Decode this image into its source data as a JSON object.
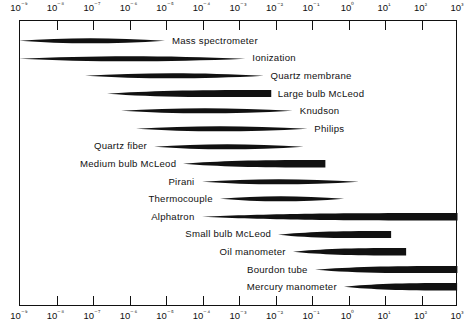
{
  "chart_data": {
    "type": "bar",
    "title": "",
    "xlabel": "",
    "ylabel": "",
    "orientation": "horizontal",
    "x_scale": "log10",
    "xlim": [
      -9,
      3
    ],
    "grid": false,
    "legend": "none",
    "axis_position": "both-top-and-bottom",
    "tick_labels": [
      "10⁻⁹",
      "10⁻⁸",
      "10⁻⁷",
      "10⁻⁶",
      "10⁻⁵",
      "10⁻⁴",
      "10⁻³",
      "10⁻²",
      "10⁻¹",
      "10⁰",
      "10¹",
      "10²",
      "10³"
    ],
    "tick_exponents": [
      -9,
      -8,
      -7,
      -6,
      -5,
      -4,
      -3,
      -2,
      -1,
      0,
      1,
      2,
      3
    ],
    "categories": [
      "Mass spectrometer",
      "Ionization",
      "Quartz membrane",
      "Large bulb McLeod",
      "Knudson",
      "Philips",
      "Quartz fiber",
      "Medium bulb McLeod",
      "Pirani",
      "Thermocouple",
      "Alphatron",
      "Small bulb McLeod",
      "Oil manometer",
      "Bourdon tube",
      "Mercury manometer"
    ],
    "bars": [
      {
        "label": "Mass spectrometer",
        "start": -9.0,
        "end": -5.0,
        "label_side": "right"
      },
      {
        "label": "Ionization",
        "start": -9.0,
        "end": -2.8,
        "label_side": "right"
      },
      {
        "label": "Quartz membrane",
        "start": -7.2,
        "end": -2.3,
        "label_side": "right"
      },
      {
        "label": "Large bulb McLeod",
        "start": -6.6,
        "end": -2.1,
        "label_side": "right"
      },
      {
        "label": "Knudson",
        "start": -6.2,
        "end": -1.5,
        "label_side": "right"
      },
      {
        "label": "Philips",
        "start": -5.8,
        "end": -1.1,
        "label_side": "right"
      },
      {
        "label": "Quartz fiber",
        "start": -5.3,
        "end": -1.2,
        "label_side": "left"
      },
      {
        "label": "Medium bulb McLeod",
        "start": -4.5,
        "end": -0.6,
        "label_side": "left"
      },
      {
        "label": "Pirani",
        "start": -4.0,
        "end": 0.3,
        "label_side": "left"
      },
      {
        "label": "Thermocouple",
        "start": -3.5,
        "end": -0.1,
        "label_side": "left"
      },
      {
        "label": "Alphatron",
        "start": -4.0,
        "end": 3.0,
        "label_side": "left"
      },
      {
        "label": "Small bulb McLeod",
        "start": -1.9,
        "end": 1.2,
        "label_side": "left"
      },
      {
        "label": "Oil manometer",
        "start": -1.5,
        "end": 1.6,
        "label_side": "left"
      },
      {
        "label": "Bourdon tube",
        "start": -0.9,
        "end": 3.0,
        "label_side": "left"
      },
      {
        "label": "Mercury manometer",
        "start": -0.1,
        "end": 3.0,
        "label_side": "left"
      }
    ]
  }
}
